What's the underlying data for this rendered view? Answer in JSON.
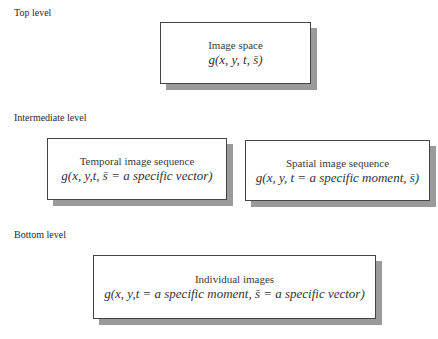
{
  "levels": {
    "top": {
      "label": "Top level",
      "boxes": [
        {
          "title": "Image space",
          "formula": "g(x, y, t, s̄)"
        }
      ]
    },
    "intermediate": {
      "label": "Intermediate level",
      "boxes": [
        {
          "title": "Temporal image sequence",
          "formula": "g(x, y,t, s̄ = a specific vector)"
        },
        {
          "title": "Spatial image sequence",
          "formula": "g(x, y, t = a specific moment, s̄)"
        }
      ]
    },
    "bottom": {
      "label": "Bottom level",
      "boxes": [
        {
          "title": "Individual images",
          "formula": "g(x, y,t = a specific moment, s̄ = a specific vector)"
        }
      ]
    }
  },
  "colors": {
    "border": "#444444",
    "shadow": "#9a9a9a",
    "background": "#ffffff"
  }
}
